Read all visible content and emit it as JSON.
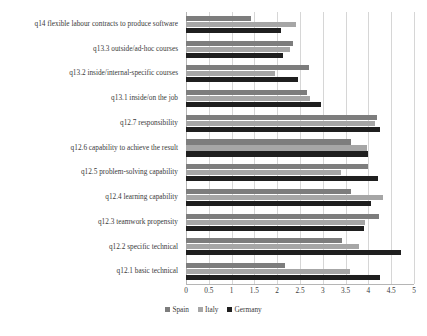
{
  "chart_data": {
    "type": "bar",
    "orientation": "horizontal",
    "title": "",
    "xlabel": "",
    "ylabel": "",
    "xlim": [
      0,
      5
    ],
    "xticks": [
      "0",
      "0.5",
      "1",
      "1.5",
      "2",
      "2.5",
      "3",
      "3.5",
      "4",
      "4.5",
      "5"
    ],
    "xtick_values": [
      0,
      0.5,
      1,
      1.5,
      2,
      2.5,
      3,
      3.5,
      4,
      4.5,
      5
    ],
    "grid": "vertical",
    "legend_position": "bottom-center",
    "categories": [
      "q14 flexible labour contracts to produce software",
      "q13.3 outside/ad-hoc courses",
      "q13.2 inside/internal-specific courses",
      "q13.1 inside/on the job",
      "q12.7 responsibility",
      "q12.6 capability to achieve the result",
      "q12.5 problem-solving capability",
      "q12.4 learning capability",
      "q12.3 teamwork propensity",
      "q12.2 specific technical",
      "q12.1 basic technical"
    ],
    "series": [
      {
        "name": "Spain",
        "color": "#7d7d7d",
        "values": [
          1.43,
          2.35,
          2.7,
          2.65,
          4.18,
          3.62,
          4.0,
          3.62,
          4.23,
          3.42,
          2.18
        ]
      },
      {
        "name": "Italy",
        "color": "#a6a6a6",
        "values": [
          2.42,
          2.28,
          1.95,
          2.72,
          4.15,
          3.97,
          3.4,
          4.33,
          3.93,
          3.8,
          3.6
        ]
      },
      {
        "name": "Germany",
        "color": "#1f1f1f",
        "values": [
          2.08,
          2.13,
          2.45,
          2.95,
          4.25,
          4.0,
          4.22,
          4.05,
          3.9,
          4.72,
          4.25
        ]
      }
    ]
  },
  "legend": {
    "items": [
      {
        "label": "Spain",
        "color": "#7d7d7d"
      },
      {
        "label": "Italy",
        "color": "#a6a6a6"
      },
      {
        "label": "Germany",
        "color": "#1f1f1f"
      }
    ]
  }
}
